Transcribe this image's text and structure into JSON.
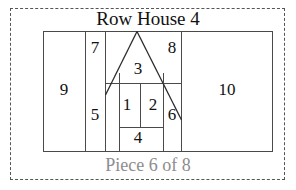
{
  "page": {
    "width": 296,
    "height": 190,
    "background_color": "#ffffff",
    "border_style": "dashed",
    "border_color": "#555555"
  },
  "header": {
    "title": "Row House 4"
  },
  "footer": {
    "caption": "Piece 6 of 8",
    "caption_color": "#8d8d8d",
    "piece_number": 6,
    "piece_total": 8
  },
  "diagram": {
    "name": "row-house-quilt-block",
    "line_color": "#4a4a4a",
    "fill_color": "#ffffff",
    "frame": {
      "x": 43,
      "y": 31,
      "width": 230,
      "height": 121
    },
    "roof_apex": {
      "x": 137,
      "y": 31
    },
    "pieces": [
      {
        "id": 1,
        "label": "1",
        "role": "window-left",
        "cx": 127,
        "cy": 106
      },
      {
        "id": 2,
        "label": "2",
        "role": "window-right",
        "cx": 153,
        "cy": 106
      },
      {
        "id": 3,
        "label": "3",
        "role": "roof-gable",
        "cx": 138,
        "cy": 70
      },
      {
        "id": 4,
        "label": "4",
        "role": "door-step",
        "cx": 138,
        "cy": 139
      },
      {
        "id": 5,
        "label": "5",
        "role": "wall-left",
        "cx": 95,
        "cy": 116
      },
      {
        "id": 6,
        "label": "6",
        "role": "wall-right",
        "cx": 172,
        "cy": 116
      },
      {
        "id": 7,
        "label": "7",
        "role": "sky-left",
        "cx": 95,
        "cy": 49
      },
      {
        "id": 8,
        "label": "8",
        "role": "sky-right",
        "cx": 172,
        "cy": 49
      },
      {
        "id": 9,
        "label": "9",
        "role": "background-left",
        "cx": 64,
        "cy": 91
      },
      {
        "id": 10,
        "label": "10",
        "role": "background-right",
        "cx": 227,
        "cy": 91
      }
    ]
  }
}
